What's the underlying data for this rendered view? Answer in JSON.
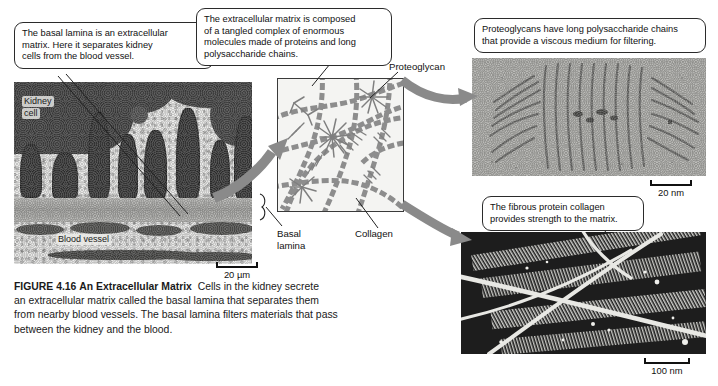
{
  "callouts": {
    "basal_lamina": {
      "lines": [
        "The basal lamina is an extracellular",
        "matrix. Here it separates kidney",
        "cells from the blood vessel."
      ]
    },
    "ecm_composition": {
      "lines": [
        "The extracellular matrix is composed",
        "of a tangled complex of enormous",
        "molecules made of proteins and long",
        "polysaccharide chains."
      ]
    },
    "proteoglycans": {
      "lines": [
        "Proteoglycans have long polysaccharide chains",
        "that provide a viscous medium for filtering."
      ]
    },
    "collagen": {
      "lines": [
        "The fibrous protein collagen",
        "provides strength to the matrix."
      ]
    }
  },
  "micrograph_labels": {
    "kidney_cell_line1": "Kidney",
    "kidney_cell_line2": "cell",
    "blood_vessel": "Blood vessel"
  },
  "diagram_labels": {
    "proteoglycan": "Proteoglycan",
    "collagen": "Collagen",
    "basal_lamina_line1": "Basal",
    "basal_lamina_line2": "lamina"
  },
  "scale_bars": {
    "left_micrograph": "20 µm",
    "proteoglycan_micrograph": "20 nm",
    "collagen_micrograph": "100 nm"
  },
  "caption": {
    "figure_number": "FIGURE 4.16",
    "figure_title": "An Extracellular Matrix",
    "line1_tail": "Cells in the kidney secrete",
    "line2": "an extracellular matrix called the basal lamina that separates them",
    "line3": "from nearby blood vessels. The basal lamina filters materials that pass",
    "line4": "between the kidney and the blood."
  },
  "colors": {
    "arrow_gray": "#8a8a8a",
    "diagram_element": "#8d8d8d",
    "callout_border": "#2b2b2b",
    "text": "#111111"
  }
}
